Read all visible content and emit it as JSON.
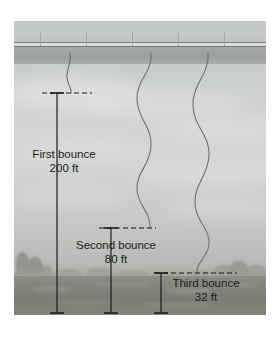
{
  "figure": {
    "scene": {
      "bridge_label": "overpass-deck",
      "ground_label": "ground",
      "sky_label": "sky"
    },
    "measurements": [
      {
        "id": "first",
        "name": "First bounce",
        "value": "200 ft",
        "line_x": 57,
        "line_top": 93,
        "line_bottom": 313,
        "dash_x1": 42,
        "dash_x2": 92,
        "dash_y": 93,
        "cap_halfwidth": 7
      },
      {
        "id": "second",
        "name": "Second bounce",
        "value": "80 ft",
        "line_x": 111,
        "line_top": 228,
        "line_bottom": 313,
        "dash_x1": 99,
        "dash_x2": 156,
        "dash_y": 228,
        "cap_halfwidth": 7
      },
      {
        "id": "third",
        "name": "Third bounce",
        "value": "32 ft",
        "line_x": 161,
        "line_top": 273,
        "line_bottom": 313,
        "dash_x1": 155,
        "dash_x2": 237,
        "dash_y": 273,
        "cap_halfwidth": 7
      }
    ],
    "cords": [
      {
        "id": "cord-1",
        "top_x": 70,
        "bottom_y": 93
      },
      {
        "id": "cord-2",
        "top_x": 151,
        "bottom_y": 228
      },
      {
        "id": "cord-3",
        "top_x": 208,
        "bottom_y": 273
      }
    ],
    "colors": {
      "annotation": "#1b1b1b",
      "cord": "#6d716e",
      "deck": "#a0a49f",
      "ground": "#83857d",
      "sky": "#cdd0cd"
    }
  }
}
